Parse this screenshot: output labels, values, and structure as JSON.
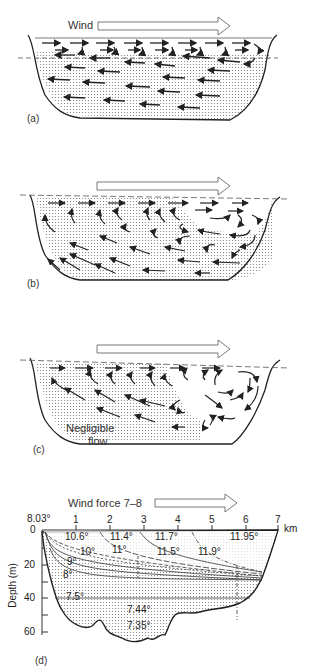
{
  "figure": {
    "panels": [
      {
        "id": "a",
        "label": "(a)",
        "wind_label": "Wind"
      },
      {
        "id": "b",
        "label": "(b)"
      },
      {
        "id": "c",
        "label": "(c)",
        "annotation": "Negligible flow",
        "annotation_lines": [
          "Negligible",
          "flow"
        ]
      },
      {
        "id": "d",
        "label": "(d)",
        "wind_label": "Wind force 7–8"
      }
    ],
    "panel_d": {
      "x_axis": {
        "unit": "km",
        "ticks": [
          "1",
          "2",
          "3",
          "4",
          "5",
          "6",
          "7"
        ],
        "origin": "0"
      },
      "y_axis": {
        "label": "Depth (m)",
        "ticks": [
          "0",
          "20",
          "40",
          "60"
        ]
      },
      "surface_temp_left": "8.03°",
      "isotherm_labels": [
        "10.6°",
        "11.4°",
        "11.7°",
        "11.95°",
        "10°",
        "11°",
        "11.5°",
        "11.9°",
        "9°",
        "8°",
        "7.5°",
        "7.44°",
        "7.35°"
      ]
    }
  }
}
